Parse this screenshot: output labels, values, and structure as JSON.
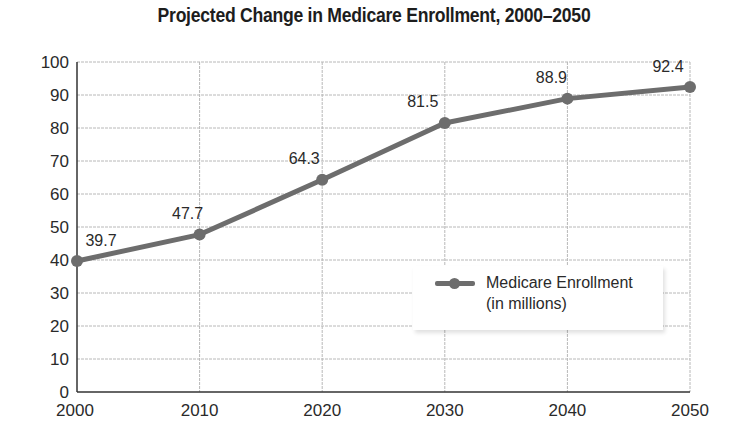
{
  "title": "Projected Change in Medicare Enrollment, 2000–2050",
  "legend": {
    "line1": "Medicare Enrollment",
    "line2": "(in millions)"
  },
  "colors": {
    "series": "#6d6d6d",
    "grid": "#b8b8b8",
    "axis": "#333333"
  },
  "chart_data": {
    "type": "line",
    "title": "Projected Change in Medicare Enrollment, 2000–2050",
    "xlabel": "",
    "ylabel": "",
    "categories": [
      "2000",
      "2010",
      "2020",
      "2030",
      "2040",
      "2050"
    ],
    "series": [
      {
        "name": "Medicare Enrollment (in millions)",
        "values": [
          39.7,
          47.7,
          64.3,
          81.5,
          88.9,
          92.4
        ]
      }
    ],
    "data_labels": [
      "39.7",
      "47.7",
      "64.3",
      "81.5",
      "88.9",
      "92.4"
    ],
    "y_ticks": [
      0,
      10,
      20,
      30,
      40,
      50,
      60,
      70,
      80,
      90,
      100
    ],
    "ylim": [
      0,
      100
    ],
    "grid": true,
    "legend_position": "inside-lower-right"
  }
}
